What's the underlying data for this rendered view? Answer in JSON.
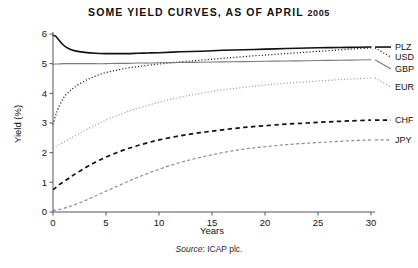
{
  "figure": {
    "title_main": "SOME YIELD CURVES, AS OF APRIL ",
    "title_year": "2005",
    "source_label": "Source",
    "source_sep": ": ",
    "source_value": "ICAP plc."
  },
  "axes": {
    "xlabel": "Years",
    "ylabel": "Yield (%)",
    "xticks": [
      "0",
      "5",
      "10",
      "15",
      "20",
      "25",
      "30"
    ],
    "yticks": [
      "0",
      "1",
      "2",
      "3",
      "4",
      "5",
      "6"
    ]
  },
  "chart_data": {
    "type": "line",
    "title": "SOME YIELD CURVES, AS OF APRIL 2005",
    "subtitle": "Source: ICAP plc.",
    "xlabel": "Years",
    "ylabel": "Yield (%)",
    "xlim": [
      0,
      30
    ],
    "ylim": [
      0,
      6
    ],
    "xticks": [
      0,
      5,
      10,
      15,
      20,
      25,
      30
    ],
    "yticks": [
      0,
      1,
      2,
      3,
      4,
      5,
      6
    ],
    "grid": false,
    "legend_position": "right-of-axes-at-curve-end",
    "x": [
      0,
      0.25,
      0.5,
      1,
      1.5,
      2,
      3,
      4,
      5,
      6,
      7,
      8,
      9,
      10,
      12,
      14,
      16,
      18,
      20,
      22,
      24,
      26,
      28,
      30
    ],
    "series": [
      {
        "name": "PLZ",
        "label": "PLZ",
        "color": "#111111",
        "style": "solid",
        "width": 1.6,
        "values": [
          5.95,
          5.93,
          5.82,
          5.62,
          5.5,
          5.44,
          5.38,
          5.35,
          5.34,
          5.34,
          5.34,
          5.35,
          5.36,
          5.37,
          5.4,
          5.42,
          5.45,
          5.47,
          5.49,
          5.51,
          5.53,
          5.54,
          5.55,
          5.56
        ]
      },
      {
        "name": "USD",
        "label": "USD",
        "color": "#111111",
        "style": "dotted",
        "width": 1.25,
        "values": [
          2.95,
          3.25,
          3.5,
          3.85,
          4.05,
          4.2,
          4.42,
          4.58,
          4.7,
          4.78,
          4.85,
          4.9,
          4.95,
          4.99,
          5.06,
          5.12,
          5.18,
          5.24,
          5.29,
          5.34,
          5.39,
          5.44,
          5.49,
          5.53
        ]
      },
      {
        "name": "GBP",
        "label": "GBP",
        "color": "#7a7a7a",
        "style": "solid",
        "width": 1.1,
        "values": [
          4.98,
          4.99,
          4.99,
          5.0,
          5.0,
          5.0,
          5.0,
          5.0,
          5.0,
          5.01,
          5.01,
          5.02,
          5.02,
          5.03,
          5.04,
          5.05,
          5.06,
          5.07,
          5.08,
          5.09,
          5.1,
          5.11,
          5.12,
          5.13
        ]
      },
      {
        "name": "EUR",
        "label": "EUR",
        "color": "#9e9e9e",
        "style": "dotted",
        "width": 1.25,
        "values": [
          2.15,
          2.2,
          2.25,
          2.35,
          2.45,
          2.55,
          2.75,
          2.93,
          3.1,
          3.25,
          3.38,
          3.5,
          3.6,
          3.7,
          3.87,
          4.0,
          4.12,
          4.2,
          4.28,
          4.34,
          4.39,
          4.44,
          4.48,
          4.52
        ]
      },
      {
        "name": "CHF",
        "label": "CHF",
        "color": "#111111",
        "style": "dashed",
        "width": 1.7,
        "values": [
          0.75,
          0.82,
          0.9,
          1.02,
          1.14,
          1.26,
          1.48,
          1.68,
          1.85,
          2.0,
          2.13,
          2.24,
          2.34,
          2.43,
          2.57,
          2.68,
          2.77,
          2.85,
          2.91,
          2.96,
          3.0,
          3.04,
          3.07,
          3.1
        ]
      },
      {
        "name": "JPY",
        "label": "JPY",
        "color": "#8a8a8a",
        "style": "dashed",
        "width": 1.2,
        "values": [
          0.05,
          0.06,
          0.08,
          0.12,
          0.18,
          0.24,
          0.38,
          0.54,
          0.7,
          0.86,
          1.02,
          1.17,
          1.31,
          1.44,
          1.67,
          1.85,
          2.0,
          2.12,
          2.2,
          2.27,
          2.32,
          2.36,
          2.4,
          2.43
        ]
      }
    ]
  },
  "legend": [
    {
      "label": "PLZ",
      "y_value": 5.56
    },
    {
      "label": "USD",
      "y_value": 5.53
    },
    {
      "label": "GBP",
      "y_value": 5.13
    },
    {
      "label": "EUR",
      "y_value": 4.52
    },
    {
      "label": "CHF",
      "y_value": 3.1
    },
    {
      "label": "JPY",
      "y_value": 2.43
    }
  ]
}
